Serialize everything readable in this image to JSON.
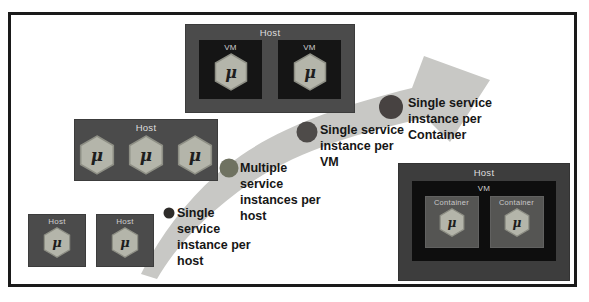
{
  "labels": {
    "host": "Host",
    "vm": "VM",
    "container": "Container",
    "microservice": "μ"
  },
  "hosts": {
    "top": {
      "label": "Host",
      "vms": [
        {
          "label": "VM",
          "service": "μ"
        },
        {
          "label": "VM",
          "service": "μ"
        }
      ]
    },
    "middle": {
      "label": "Host",
      "services": [
        "μ",
        "μ",
        "μ"
      ]
    },
    "small": [
      {
        "label": "Host",
        "service": "μ"
      },
      {
        "label": "Host",
        "service": "μ"
      }
    ],
    "bottom_right": {
      "label": "Host",
      "vm": {
        "label": "VM",
        "containers": [
          {
            "label": "Container",
            "service": "μ"
          },
          {
            "label": "Container",
            "service": "μ"
          }
        ]
      }
    }
  },
  "annotations": [
    {
      "lines": [
        "Single",
        "service",
        "instance per",
        "host"
      ]
    },
    {
      "lines": [
        "Multiple",
        "service",
        "instances per",
        "host"
      ]
    },
    {
      "lines": [
        "Single service",
        "instance per",
        "VM"
      ]
    },
    {
      "lines": [
        "Single service",
        "instance per",
        "Container"
      ]
    }
  ],
  "colors": {
    "background": "#ffffff",
    "frame_border": "#1a1a1a",
    "arrow": "#c8c8c5",
    "host_box": "#4b4b4b",
    "host_box_bottom_right": "#3d3d3d",
    "vm_box": "#151515",
    "container_box": "#555553",
    "hexagon_fill": "#b4b5aa",
    "hexagon_edge": "#8e8f85",
    "bullet_single_host": "#2e2c2a",
    "bullet_multiple_host": "#6f7261",
    "bullet_vm": "#4e4b49",
    "bullet_container": "#474241",
    "annotation_text": "#161616",
    "box_label_text": "#dedede"
  }
}
